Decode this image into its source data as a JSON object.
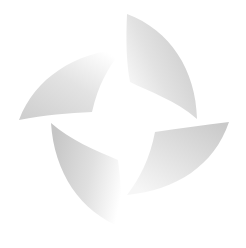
{
  "canvas": {
    "width": 246,
    "height": 248,
    "background": "#ffffff"
  },
  "logo": {
    "name": "four-blade pinwheel emblem",
    "colors": {
      "dark": "#c4c4c4",
      "mid": "#dcdcdc",
      "light": "#ffffff"
    },
    "blades": [
      {
        "id": "top",
        "path": "M127,14 C170,30 196,70 197,119 C175,100 150,92 130,82 C126,60 126,38 127,14 Z"
      },
      {
        "id": "left",
        "path": "M19,120 C35,78 75,52 124,49 C108,66 98,86 92,112 C68,113 45,115 19,120 Z"
      },
      {
        "id": "bottom",
        "path": "M51,123 C70,140 95,150 118,160 C121,183 122,205 123,228 C80,212 54,172 51,123 Z"
      },
      {
        "id": "right",
        "path": "M229,122 C214,166 176,190 127,195 C140,178 150,158 155,132 C180,128 205,125 229,122 Z"
      }
    ]
  }
}
